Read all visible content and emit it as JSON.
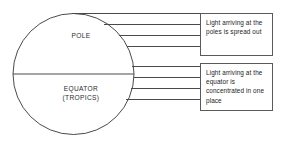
{
  "diagram": {
    "background_color": "#ffffff",
    "line_color": "#4a4a4a",
    "text_color": "#2b2b2b",
    "globe": {
      "pole_label": "POLE",
      "equator_label_line1": "EQUATOR",
      "equator_label_line2": "(TROPICS)",
      "center_x": 73.5,
      "center_y": 74,
      "radius": 60.5,
      "equator_line_y": 74
    },
    "rays": {
      "pole_rays": [
        {
          "x1": 72,
          "y1": 13.5,
          "x2": 200,
          "y2": 13.5
        },
        {
          "x1": 104,
          "y1": 24.5,
          "x2": 200,
          "y2": 24.5
        },
        {
          "x1": 119,
          "y1": 35.5,
          "x2": 200,
          "y2": 35.5
        },
        {
          "x1": 127,
          "y1": 46.5,
          "x2": 200,
          "y2": 46.5
        }
      ],
      "equator_rays": [
        {
          "x1": 132,
          "y1": 66.5,
          "x2": 200,
          "y2": 66.5
        },
        {
          "x1": 134,
          "y1": 77.5,
          "x2": 200,
          "y2": 77.5
        },
        {
          "x1": 131,
          "y1": 88.5,
          "x2": 200,
          "y2": 88.5
        },
        {
          "x1": 126,
          "y1": 99.5,
          "x2": 200,
          "y2": 99.5
        }
      ]
    },
    "callouts": [
      {
        "id": "poles",
        "text": "Light arriving at the poles is spread out",
        "border_color": "#5a5a5a"
      },
      {
        "id": "equator",
        "text": "Light arriving at the equator is concentrated in one place",
        "border_color": "#5a5a5a"
      }
    ]
  }
}
